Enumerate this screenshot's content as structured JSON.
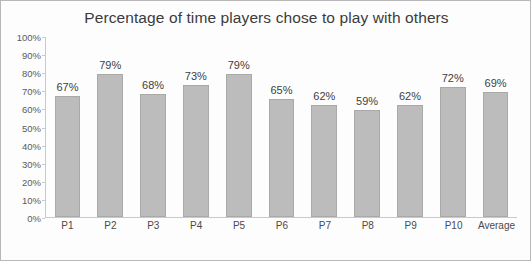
{
  "chart_data": {
    "type": "bar",
    "title": "Percentage of time players chose to play with others",
    "xlabel": "",
    "ylabel": "",
    "categories": [
      "P1",
      "P2",
      "P3",
      "P4",
      "P5",
      "P6",
      "P7",
      "P8",
      "P9",
      "P10",
      "Average"
    ],
    "values": [
      67,
      79,
      68,
      73,
      79,
      65,
      62,
      59,
      62,
      72,
      69
    ],
    "data_labels": [
      "67%",
      "79%",
      "68%",
      "73%",
      "79%",
      "65%",
      "62%",
      "59%",
      "62%",
      "72%",
      "69%"
    ],
    "ylim": [
      0,
      100
    ],
    "yticks": [
      0,
      10,
      20,
      30,
      40,
      50,
      60,
      70,
      80,
      90,
      100
    ],
    "ytick_labels": [
      "0%",
      "10%",
      "20%",
      "30%",
      "40%",
      "50%",
      "60%",
      "70%",
      "80%",
      "90%",
      "100%"
    ],
    "grid": false,
    "legend": false,
    "bar_color": "#bcbcbc"
  }
}
